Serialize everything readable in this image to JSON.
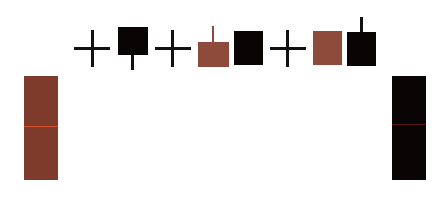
{
  "colors": {
    "brown": "#7e3a2a",
    "brown_light": "#8e4a3a",
    "black": "#0a0505",
    "cross": "#111111",
    "midline_red": "#d0502e",
    "midline_dark": "#5a1a12",
    "background": "#ffffff"
  },
  "elements": [
    {
      "id": "left-tall-bar",
      "shape": "tall-bar",
      "color": "brown",
      "has_midline": true
    },
    {
      "id": "cross-1",
      "shape": "doji-cross"
    },
    {
      "id": "black-square-1",
      "shape": "square",
      "color": "black",
      "wick": "lower"
    },
    {
      "id": "cross-2",
      "shape": "doji-cross"
    },
    {
      "id": "brown-square-1",
      "shape": "square",
      "color": "brown",
      "wick": "upper"
    },
    {
      "id": "black-square-2",
      "shape": "square",
      "color": "black",
      "wick": "none"
    },
    {
      "id": "cross-3",
      "shape": "doji-cross"
    },
    {
      "id": "brown-square-2",
      "shape": "square",
      "color": "brown",
      "wick": "none"
    },
    {
      "id": "black-square-3",
      "shape": "square",
      "color": "black",
      "wick": "upper"
    },
    {
      "id": "right-tall-bar",
      "shape": "tall-bar",
      "color": "black",
      "has_midline": true
    }
  ]
}
